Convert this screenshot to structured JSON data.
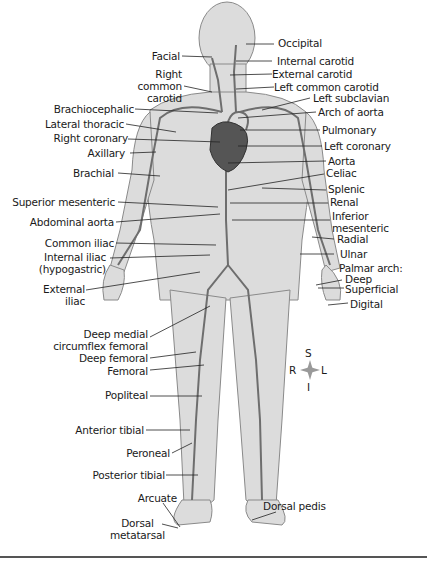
{
  "figure": {
    "colors": {
      "body": "#d9d9d9",
      "outline": "#8a8a8a",
      "artery": "#6e6e6e",
      "heart": "#555555",
      "leader": "#222222"
    },
    "labels_left": [
      {
        "id": "facial",
        "text": "Facial"
      },
      {
        "id": "right-common-carotid",
        "text": "Right\ncommon\ncarotid"
      },
      {
        "id": "brachiocephalic",
        "text": "Brachiocephalic"
      },
      {
        "id": "lateral-thoracic",
        "text": "Lateral thoracic"
      },
      {
        "id": "right-coronary",
        "text": "Right coronary"
      },
      {
        "id": "axillary",
        "text": "Axillary"
      },
      {
        "id": "brachial",
        "text": "Brachial"
      },
      {
        "id": "superior-mesenteric",
        "text": "Superior mesenteric"
      },
      {
        "id": "abdominal-aorta",
        "text": "Abdominal aorta"
      },
      {
        "id": "common-iliac",
        "text": "Common iliac"
      },
      {
        "id": "internal-iliac",
        "text": "Internal iliac\n(hypogastric)"
      },
      {
        "id": "external-iliac",
        "text": "External\niliac"
      },
      {
        "id": "deep-medial-circumflex-femoral",
        "text": "Deep medial\ncircumflex femoral"
      },
      {
        "id": "deep-femoral",
        "text": "Deep femoral"
      },
      {
        "id": "femoral",
        "text": "Femoral"
      },
      {
        "id": "popliteal",
        "text": "Popliteal"
      },
      {
        "id": "anterior-tibial",
        "text": "Anterior tibial"
      },
      {
        "id": "peroneal",
        "text": "Peroneal"
      },
      {
        "id": "posterior-tibial",
        "text": "Posterior tibial"
      },
      {
        "id": "arcuate",
        "text": "Arcuate"
      },
      {
        "id": "dorsal-metatarsal",
        "text": "Dorsal\nmetatarsal"
      }
    ],
    "labels_right": [
      {
        "id": "occipital",
        "text": "Occipital"
      },
      {
        "id": "internal-carotid",
        "text": "Internal carotid"
      },
      {
        "id": "external-carotid",
        "text": "External carotid"
      },
      {
        "id": "left-common-carotid",
        "text": "Left common carotid"
      },
      {
        "id": "left-subclavian",
        "text": "Left subclavian"
      },
      {
        "id": "arch-of-aorta",
        "text": "Arch of aorta"
      },
      {
        "id": "pulmonary",
        "text": "Pulmonary"
      },
      {
        "id": "left-coronary",
        "text": "Left coronary"
      },
      {
        "id": "aorta",
        "text": "Aorta"
      },
      {
        "id": "celiac",
        "text": "Celiac"
      },
      {
        "id": "splenic",
        "text": "Splenic"
      },
      {
        "id": "renal",
        "text": "Renal"
      },
      {
        "id": "inferior-mesenteric",
        "text": "Inferior\nmesenteric"
      },
      {
        "id": "radial",
        "text": "Radial"
      },
      {
        "id": "ulnar",
        "text": "Ulnar"
      },
      {
        "id": "palmar-arch",
        "text": "Palmar arch:"
      },
      {
        "id": "deep",
        "text": "Deep"
      },
      {
        "id": "superficial",
        "text": "Superficial"
      },
      {
        "id": "digital",
        "text": "Digital"
      },
      {
        "id": "dorsal-pedis",
        "text": "Dorsal pedis"
      }
    ],
    "compass": {
      "superior": "S",
      "inferior": "I",
      "right": "R",
      "left": "L"
    }
  }
}
